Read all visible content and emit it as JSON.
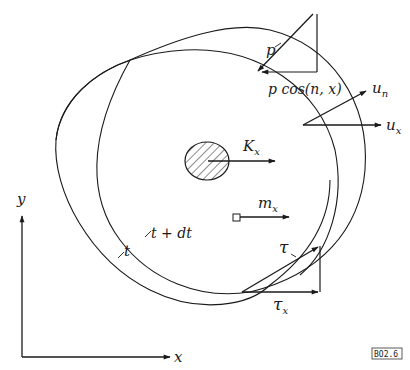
{
  "figure": {
    "id_tag": "BO2.6",
    "axes": {
      "x_label": "x",
      "y_label": "y"
    },
    "curves": {
      "t_label": "t",
      "t_dt_label": "t + dt"
    },
    "vectors": {
      "p_label": "p",
      "p_cos_label": "p cos(n, x)",
      "u_n_label": "u",
      "u_n_sub": "n",
      "u_x_label": "u",
      "u_x_sub": "x",
      "K_label": "K",
      "K_sub": "x",
      "m_label": "m",
      "m_sub": "x",
      "tau_label": "τ",
      "tau_x_label": "τ",
      "tau_x_sub": "x"
    }
  },
  "colors": {
    "ink": "#1a1a1a",
    "background": "#ffffff"
  }
}
